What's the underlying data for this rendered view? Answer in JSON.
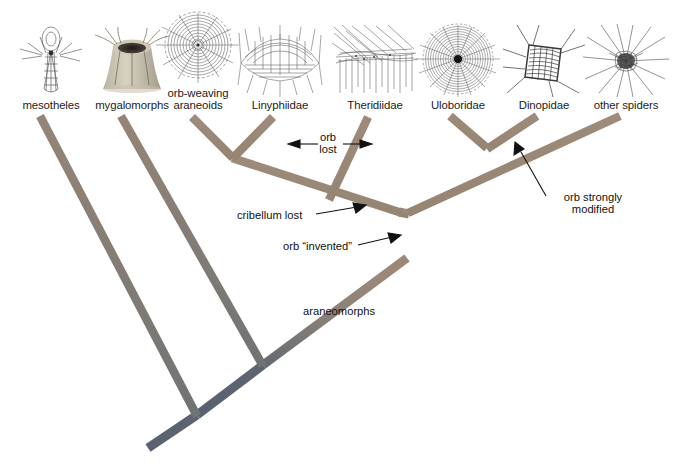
{
  "diagram": {
    "background_color": "#ffffff",
    "branch_color_top": "#9c8878",
    "branch_color_mid": "#7b7574",
    "branch_color_base": "#5a6370"
  },
  "taxa": [
    {
      "label": "mesotheles",
      "icon": "spider-web-tube-icon",
      "x": 3,
      "tip_x": 40,
      "tip_y": 116
    },
    {
      "label": "mygalomorphs",
      "icon": "spider-web-funnel-icon",
      "x": 84,
      "tip_x": 121,
      "tip_y": 116
    },
    {
      "label": "orb-weaving\naraneoids",
      "icon": "spider-web-orb-icon",
      "x": 150,
      "tip_x": 192,
      "tip_y": 117
    },
    {
      "label": "Linyphiidae",
      "icon": "spider-web-sheet-icon",
      "x": 232,
      "tip_x": 273,
      "tip_y": 117
    },
    {
      "label": "Theridiidae",
      "icon": "spider-web-tangle-icon",
      "x": 327,
      "tip_x": 368,
      "tip_y": 117
    },
    {
      "label": "Uloboridae",
      "icon": "spider-web-orb-dense-icon",
      "x": 410,
      "tip_x": 450,
      "tip_y": 116
    },
    {
      "label": "Dinopidae",
      "icon": "spider-web-cast-icon",
      "x": 496,
      "tip_x": 537,
      "tip_y": 116
    },
    {
      "label": "other spiders",
      "icon": "spider-web-radial-icon",
      "x": 578,
      "tip_x": 620,
      "tip_y": 116
    }
  ],
  "annotations": [
    {
      "id": "orb-lost",
      "label": "orb\nlost",
      "x": 295,
      "y": 134,
      "align": "center",
      "arrows": "double"
    },
    {
      "id": "cribellum-lost",
      "label": "cribellum lost",
      "x": 240,
      "y": 209,
      "align": "left",
      "arrows": "single-right"
    },
    {
      "id": "orb-invented",
      "label": "orb “invented”",
      "x": 285,
      "y": 241,
      "align": "left",
      "arrows": "single-right"
    },
    {
      "id": "orb-strongly-modified",
      "label": "orb strongly\nmodified",
      "x": 551,
      "y": 197,
      "align": "left",
      "arrows": "single-up-left"
    },
    {
      "id": "araneomorphs",
      "label": "araneomorphs",
      "x": 305,
      "y": 307,
      "align": "left",
      "arrows": "none"
    }
  ],
  "tree": {
    "root_tip": {
      "x": 148,
      "y": 448
    },
    "node_mesotheles": {
      "x": 197,
      "y": 415
    },
    "node_mygalomorphs": {
      "x": 263,
      "y": 365
    },
    "node_araneomorphs": {
      "x": 407,
      "y": 258
    },
    "node_orb_invented": {
      "x": 407,
      "y": 213
    },
    "node_cribellum_lost": {
      "x": 407,
      "y": 213
    },
    "node_araneoid_clade": {
      "x": 399,
      "y": 212
    },
    "node_araneoid_split": {
      "x": 232,
      "y": 158
    },
    "node_right_clade": {
      "x": 487,
      "y": 148
    }
  }
}
